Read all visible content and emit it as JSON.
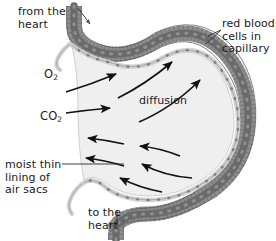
{
  "diagram": {
    "background_color": "#ffffff",
    "text_color": "#1a1a1a"
  },
  "labels": {
    "from_heart": "from the\nheart",
    "red_blood_cells": "red blood\ncells in\ncapillary",
    "oxygen": "O",
    "oxygen_sub": "2",
    "diffusion": "diffusion",
    "carbon_dioxide": "CO",
    "carbon_dioxide_sub": "2",
    "moist_lining": "moist thin\nlining of\nair sacs",
    "to_heart": "to the\nheart"
  },
  "structures": {
    "alveolus": {
      "name": "alveolus air sac",
      "fill_color": "#efefef",
      "outline_color": "#b9b9b9"
    },
    "capillary": {
      "name": "capillary vessel",
      "wall_color": "#9a9a9a",
      "wall_edge_color": "#6e6e6e",
      "red_blood_cell_color": "#6f6f6f",
      "red_blood_cell_count": 46
    },
    "alveolar_lining": {
      "name": "moist thin lining of air sacs",
      "color": "#bdbdbd",
      "nuclei_color": "#8a8a8a"
    }
  },
  "arrows": {
    "color": "#111111",
    "oxygen_direction": "rightward into capillary",
    "carbon_dioxide_direction": "leftward into alveolus",
    "oxygen_arrow_count": 4,
    "carbon_dioxide_arrow_count": 5,
    "blood_flow_in": "downward into capillary from the heart",
    "blood_flow_out": "downward out of capillary to the heart"
  }
}
